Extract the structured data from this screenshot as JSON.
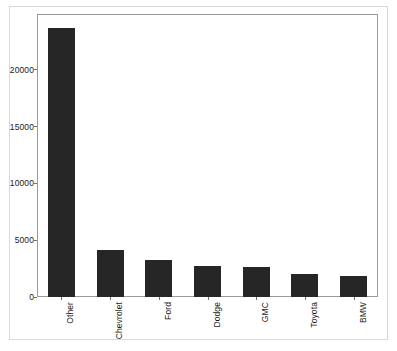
{
  "chart_data": {
    "type": "bar",
    "title": "",
    "xlabel": "",
    "ylabel": "",
    "categories": [
      "Other",
      "Chevrolet",
      "Ford",
      "Dodge",
      "GMC",
      "Toyota",
      "BMW"
    ],
    "values": [
      23700,
      4100,
      3300,
      2750,
      2650,
      2000,
      1850
    ],
    "ylim": [
      0,
      24900
    ],
    "yticks": [
      0,
      5000,
      10000,
      15000,
      20000
    ],
    "ytick_labels": [
      "0",
      "5000",
      "10000",
      "15000",
      "20000"
    ],
    "grid": false,
    "legend": null,
    "bar_color": "#262626",
    "axes_color": "#9a9a9a",
    "frame_color": "#d9d9d9",
    "background": "#ffffff",
    "xtick_label_rotation": 90
  }
}
